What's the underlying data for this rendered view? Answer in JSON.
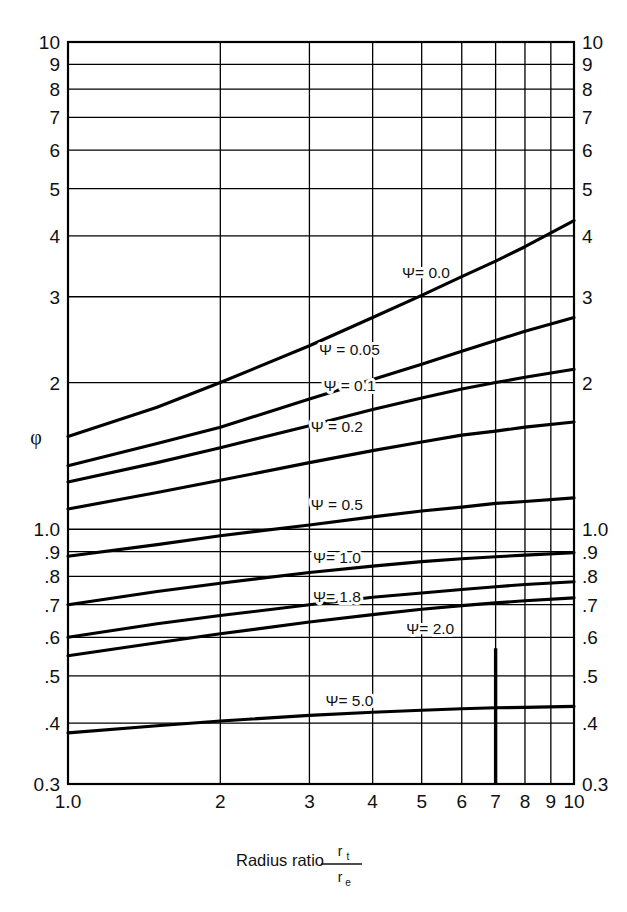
{
  "header": {
    "title": "EQUIPMENT SELECTION, SPECIFICATION AND DESIGN"
  },
  "chart_data": {
    "type": "line",
    "title": "",
    "xlabel": "Radius ratio r_t / r_e",
    "xlabel_parts": {
      "text": "Radius ratio",
      "numerator": "r",
      "numerator_sub": "t",
      "denominator": "r",
      "denominator_sub": "e"
    },
    "ylabel": "φ",
    "xscale": "log",
    "yscale": "log",
    "xlim": [
      1.0,
      10.0
    ],
    "ylim": [
      0.3,
      10.0
    ],
    "grid": true,
    "legend_position": "inline-labels",
    "x_ticks": [
      "1.0",
      "2",
      "3",
      "4",
      "5",
      "6",
      "7",
      "8",
      "9",
      "10"
    ],
    "x_tick_values": [
      1,
      2,
      3,
      4,
      5,
      6,
      7,
      8,
      9,
      10
    ],
    "y_ticks_left": [
      "10",
      "9",
      "8",
      "7",
      "6",
      "5",
      "4",
      "3",
      "2",
      "1.0",
      ".9",
      ".8",
      ".7",
      ".6",
      ".5",
      ".4",
      "0.3"
    ],
    "y_ticks_right": [
      "10",
      "9",
      "8",
      "7",
      "6",
      "5",
      "4",
      "3",
      "2",
      "1.0",
      ".9",
      ".8",
      ".7",
      ".6",
      ".5",
      ".4",
      "0.3"
    ],
    "y_tick_values": [
      10,
      9,
      8,
      7,
      6,
      5,
      4,
      3,
      2,
      1.0,
      0.9,
      0.8,
      0.7,
      0.6,
      0.5,
      0.4,
      0.3
    ],
    "series": [
      {
        "name": "Ψ= 0.0",
        "psi": 0.0,
        "label": "Ψ= 0.0",
        "x": [
          1.0,
          1.5,
          2.0,
          3.0,
          4.0,
          5.0,
          6.0,
          7.0,
          8.0,
          10.0
        ],
        "y": [
          1.55,
          1.78,
          2.0,
          2.38,
          2.72,
          3.02,
          3.3,
          3.55,
          3.8,
          4.3
        ]
      },
      {
        "name": "Ψ = 0.05",
        "psi": 0.05,
        "label": "Ψ = 0.05",
        "x": [
          1.0,
          1.5,
          2.0,
          3.0,
          4.0,
          5.0,
          6.0,
          7.0,
          8.0,
          10.0
        ],
        "y": [
          1.35,
          1.5,
          1.62,
          1.85,
          2.03,
          2.18,
          2.32,
          2.44,
          2.55,
          2.72
        ]
      },
      {
        "name": "Ψ = 0.1",
        "psi": 0.1,
        "label": "Ψ = 0.1",
        "x": [
          1.0,
          1.5,
          2.0,
          3.0,
          4.0,
          5.0,
          6.0,
          7.0,
          8.0,
          10.0
        ],
        "y": [
          1.25,
          1.37,
          1.47,
          1.63,
          1.76,
          1.86,
          1.94,
          2.0,
          2.05,
          2.13
        ]
      },
      {
        "name": "Ψ = 0.2",
        "psi": 0.2,
        "label": "Ψ = 0.2",
        "x": [
          1.0,
          1.5,
          2.0,
          3.0,
          4.0,
          5.0,
          6.0,
          7.0,
          8.0,
          10.0
        ],
        "y": [
          1.1,
          1.19,
          1.26,
          1.37,
          1.45,
          1.51,
          1.56,
          1.59,
          1.62,
          1.66
        ]
      },
      {
        "name": "Ψ = 0.5",
        "psi": 0.5,
        "label": "Ψ = 0.5",
        "x": [
          1.0,
          1.5,
          2.0,
          3.0,
          4.0,
          5.0,
          6.0,
          7.0,
          8.0,
          10.0
        ],
        "y": [
          0.88,
          0.93,
          0.97,
          1.02,
          1.06,
          1.09,
          1.11,
          1.13,
          1.14,
          1.16
        ]
      },
      {
        "name": "Ψ= 1.0",
        "psi": 1.0,
        "label": "Ψ= 1.0",
        "x": [
          1.0,
          1.5,
          2.0,
          3.0,
          4.0,
          5.0,
          6.0,
          7.0,
          8.0,
          10.0
        ],
        "y": [
          0.7,
          0.745,
          0.775,
          0.815,
          0.84,
          0.858,
          0.87,
          0.878,
          0.885,
          0.895
        ]
      },
      {
        "name": "Ψ= 1.8",
        "psi": 1.8,
        "label": "Ψ= 1.8",
        "x": [
          1.0,
          1.5,
          2.0,
          3.0,
          4.0,
          5.0,
          6.0,
          7.0,
          8.0,
          10.0
        ],
        "y": [
          0.6,
          0.64,
          0.665,
          0.7,
          0.725,
          0.74,
          0.752,
          0.762,
          0.77,
          0.78
        ]
      },
      {
        "name": "Ψ= 2.0",
        "psi": 2.0,
        "label": "Ψ= 2.0",
        "x": [
          1.0,
          1.5,
          2.0,
          3.0,
          4.0,
          5.0,
          6.0,
          7.0,
          8.0,
          10.0
        ],
        "y": [
          0.55,
          0.585,
          0.61,
          0.645,
          0.668,
          0.685,
          0.697,
          0.706,
          0.713,
          0.723
        ]
      },
      {
        "name": "Ψ= 5.0",
        "psi": 5.0,
        "label": "Ψ= 5.0",
        "x": [
          1.0,
          1.5,
          2.0,
          3.0,
          4.0,
          5.0,
          6.0,
          7.0,
          8.0,
          10.0
        ],
        "y": [
          0.382,
          0.395,
          0.404,
          0.415,
          0.421,
          0.425,
          0.428,
          0.43,
          0.431,
          0.433
        ]
      }
    ],
    "annotations": [
      {
        "text": "Ψ= 0.0",
        "x": 5.1,
        "y": 3.35
      },
      {
        "text": "Ψ = 0.05",
        "x": 3.6,
        "y": 2.33
      },
      {
        "text": "Ψ = 0.1",
        "x": 3.6,
        "y": 1.97
      },
      {
        "text": "Ψ = 0.2",
        "x": 3.4,
        "y": 1.62
      },
      {
        "text": "Ψ = 0.5",
        "x": 3.4,
        "y": 1.12
      },
      {
        "text": "Ψ= 1.0",
        "x": 3.4,
        "y": 0.872
      },
      {
        "text": "Ψ= 1.8",
        "x": 3.4,
        "y": 0.725
      },
      {
        "text": "Ψ= 2.0",
        "x": 5.2,
        "y": 0.625
      },
      {
        "text": "Ψ= 5.0",
        "x": 3.6,
        "y": 0.445
      }
    ],
    "emphasis_marks": [
      {
        "type": "vertical-line",
        "x": 7.0,
        "y_from": 0.3,
        "y_to": 0.57
      }
    ],
    "colors": {
      "curve": "#000000",
      "grid": "#000000",
      "axis": "#000000",
      "background": "#ffffff"
    }
  }
}
